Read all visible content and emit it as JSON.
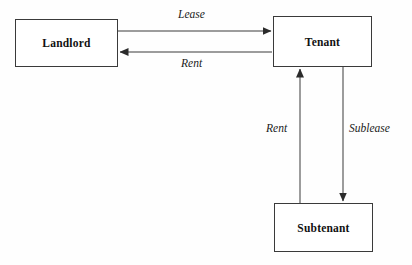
{
  "diagram": {
    "background_color": "#fefefe",
    "line_color": "#3a3a3a",
    "text_color": "#111111",
    "nodes": [
      {
        "id": "landlord",
        "label": "Landlord",
        "x": 15,
        "y": 19,
        "width": 103,
        "height": 48
      },
      {
        "id": "tenant",
        "label": "Tenant",
        "x": 273,
        "y": 16,
        "width": 99,
        "height": 51
      },
      {
        "id": "subtenant",
        "label": "Subtenant",
        "x": 274,
        "y": 203,
        "width": 99,
        "height": 49
      }
    ],
    "edges": [
      {
        "id": "lease",
        "label": "Lease",
        "from": "landlord",
        "to": "tenant",
        "direction": "right",
        "label_x": 178,
        "label_y": 8
      },
      {
        "id": "rent-top",
        "label": "Rent",
        "from": "tenant",
        "to": "landlord",
        "direction": "left",
        "label_x": 181,
        "label_y": 57
      },
      {
        "id": "rent-sub",
        "label": "Rent",
        "from": "subtenant",
        "to": "tenant",
        "direction": "up",
        "label_x": 266,
        "label_y": 122
      },
      {
        "id": "sublease",
        "label": "Sublease",
        "from": "tenant",
        "to": "subtenant",
        "direction": "down",
        "label_x": 349,
        "label_y": 122
      }
    ]
  }
}
